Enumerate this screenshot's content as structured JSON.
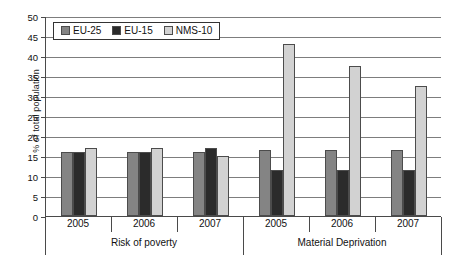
{
  "chart_data": {
    "type": "bar",
    "title": "",
    "xlabel": "",
    "ylabel": "% of total population",
    "ylim": [
      0,
      50
    ],
    "ytick_step": 5,
    "yticks": [
      0,
      5,
      10,
      15,
      20,
      25,
      30,
      35,
      40,
      45,
      50
    ],
    "grid": true,
    "legend_position": "top-left",
    "groups": [
      {
        "name": "Risk of poverty",
        "categories": [
          "2005",
          "2006",
          "2007"
        ]
      },
      {
        "name": "Material Deprivation",
        "categories": [
          "2005",
          "2006",
          "2007"
        ]
      }
    ],
    "categories": [
      "2005",
      "2006",
      "2007",
      "2005",
      "2006",
      "2007"
    ],
    "series": [
      {
        "name": "EU-25",
        "color": "#848484",
        "values": [
          16,
          16,
          16,
          16.5,
          16.5,
          16.5
        ]
      },
      {
        "name": "EU-15",
        "color": "#2b2b2b",
        "values": [
          16,
          16,
          17,
          11.5,
          11.5,
          11.5
        ]
      },
      {
        "name": "NMS-10",
        "color": "#d2d2d2",
        "values": [
          17,
          17,
          15,
          43,
          37.5,
          32.5
        ]
      }
    ]
  },
  "legend": {
    "items": [
      {
        "label": "EU-25",
        "swatch": "series-0-swatch"
      },
      {
        "label": "EU-15",
        "swatch": "series-1-swatch"
      },
      {
        "label": "NMS-10",
        "swatch": "series-2-swatch"
      }
    ]
  },
  "axis": {
    "y_title": "% of total population",
    "y_tick_labels": [
      "50",
      "45",
      "40",
      "35",
      "30",
      "25",
      "20",
      "15",
      "10",
      "5",
      "0"
    ],
    "x_category_labels": [
      "2005",
      "2006",
      "2007",
      "2005",
      "2006",
      "2007"
    ],
    "x_group_labels": [
      "Risk of poverty",
      "Material Deprivation"
    ]
  },
  "colors": {
    "series_0": "#848484",
    "series_1": "#2b2b2b",
    "series_2": "#d2d2d2",
    "axis": "#4a4a4a",
    "gridline": "#7d7d7d",
    "background": "#ffffff"
  }
}
